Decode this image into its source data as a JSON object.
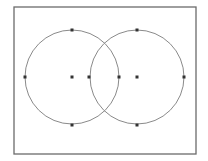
{
  "diagram": {
    "type": "two-overlapping-circles",
    "colors": {
      "background": "#ffffff",
      "frame": "#6b6b6b",
      "circle": "#8a8a8a",
      "point": "#333333"
    },
    "frame": {
      "x": 14,
      "y": 7,
      "width": 182,
      "height": 147
    },
    "circles": [
      {
        "name": "left",
        "cx": 72,
        "cy": 77,
        "r": 47
      },
      {
        "name": "right",
        "cx": 137,
        "cy": 77,
        "r": 47
      }
    ],
    "points": [
      {
        "name": "left-top",
        "x": 72,
        "y": 30
      },
      {
        "name": "left-left",
        "x": 25,
        "y": 77
      },
      {
        "name": "left-center",
        "x": 72,
        "y": 77
      },
      {
        "name": "right-left",
        "x": 89,
        "y": 77
      },
      {
        "name": "left-right",
        "x": 119,
        "y": 77
      },
      {
        "name": "right-center",
        "x": 137,
        "y": 77
      },
      {
        "name": "right-right",
        "x": 184,
        "y": 77
      },
      {
        "name": "left-bottom",
        "x": 72,
        "y": 125
      },
      {
        "name": "right-top",
        "x": 137,
        "y": 30
      },
      {
        "name": "right-bottom",
        "x": 137,
        "y": 125
      }
    ]
  }
}
